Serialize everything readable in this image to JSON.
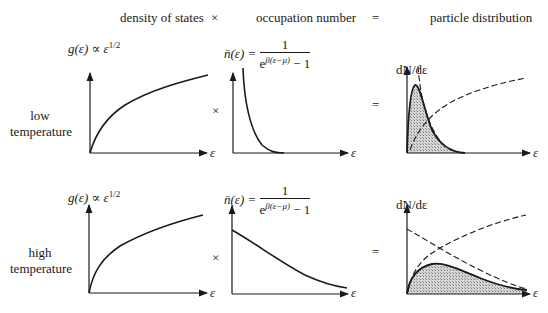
{
  "header": {
    "col1": "density of states",
    "op1": "×",
    "col2": "occupation number",
    "op2": "=",
    "col3": "particle distribution"
  },
  "rows": [
    {
      "label_line1": "low",
      "label_line2": "temperature",
      "op_times": "×",
      "op_equals": "=",
      "dos_formula": "g(ε) ∝ ε^1/2",
      "dos_lhs": "g(ε) ∝ ε",
      "dos_exp": "1/2",
      "occ_lhs": "n̄(ε) =",
      "occ_num": "1",
      "occ_den_base": "e",
      "occ_den_exp": "β(ε−μ)",
      "occ_den_tail": " − 1",
      "dist_ylabel": "dN/dε",
      "x_axis_label": "ε"
    },
    {
      "label_line1": "high",
      "label_line2": "temperature",
      "op_times": "×",
      "op_equals": "=",
      "dos_formula": "g(ε) ∝ ε^1/2",
      "dos_lhs": "g(ε) ∝ ε",
      "dos_exp": "1/2",
      "occ_lhs": "n̄(ε) =",
      "occ_num": "1",
      "occ_den_base": "e",
      "occ_den_exp": "β(ε−μ)",
      "occ_den_tail": " − 1",
      "dist_ylabel": "dN/dε",
      "x_axis_label": "ε"
    }
  ],
  "colors": {
    "ink": "#1a1a1a",
    "shade": "#bdbdbd"
  }
}
